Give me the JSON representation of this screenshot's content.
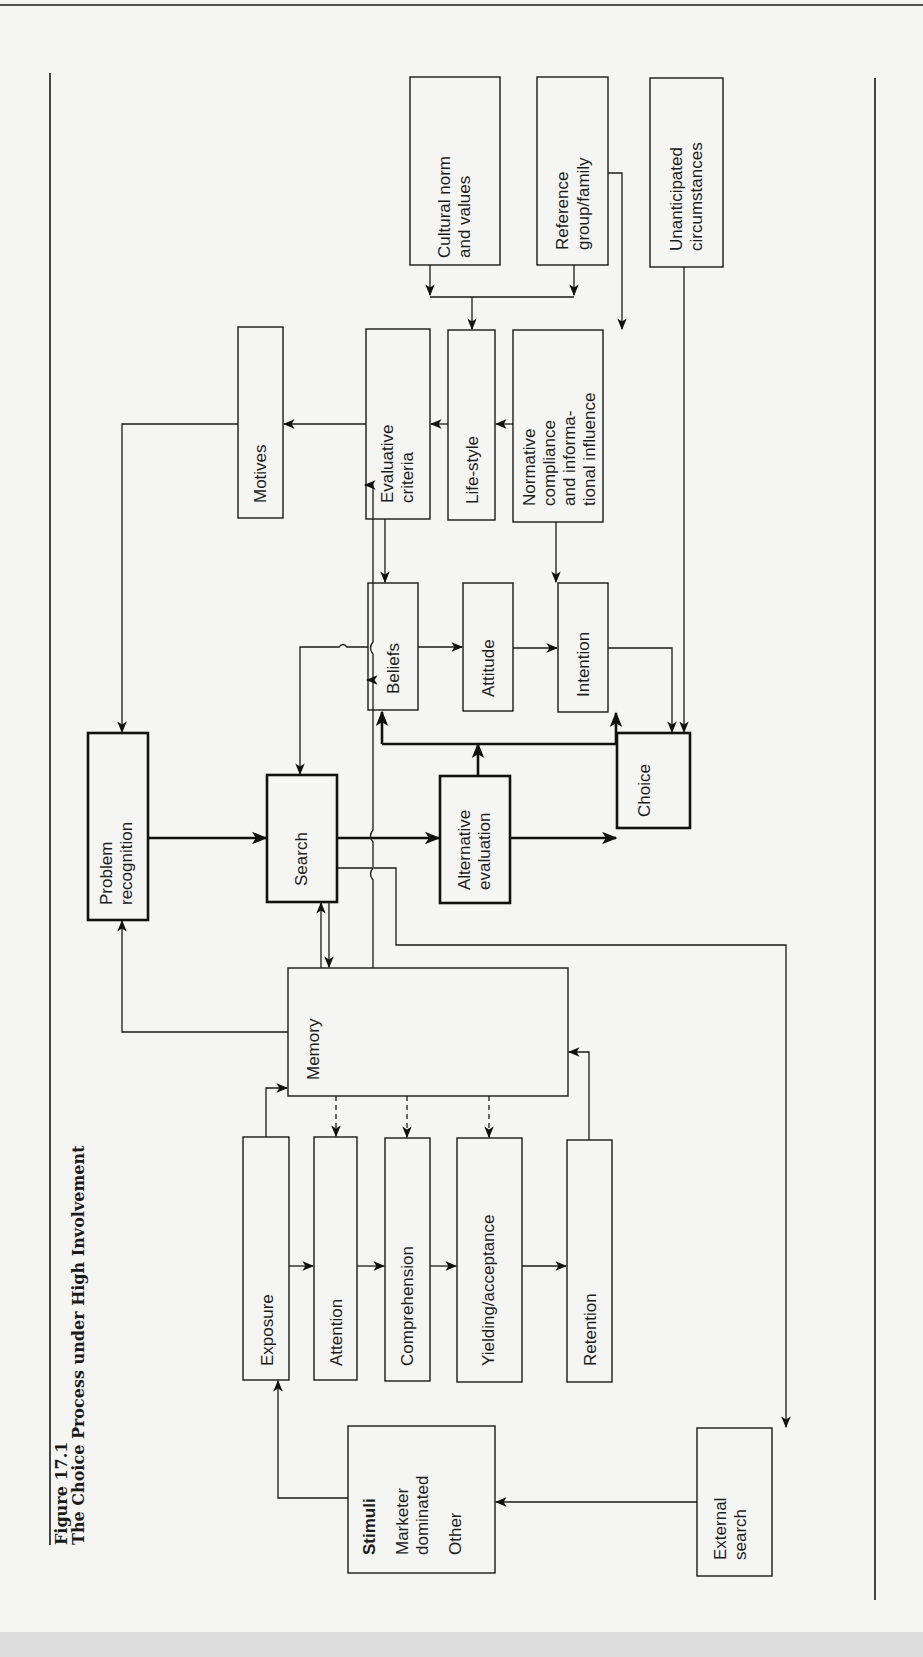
{
  "figure": {
    "number": "Figure 17.1",
    "title": "The Choice Process under High Involvement",
    "orientation": "rotated-90-ccw"
  },
  "nodes": {
    "cultural_norm": [
      "Cultural norm",
      "and values"
    ],
    "reference_group": [
      "Reference",
      "group/family"
    ],
    "unanticipated": [
      "Unanticipated",
      "circumstances"
    ],
    "motives": [
      "Motives"
    ],
    "evaluative_criteria": [
      "Evaluative",
      "criteria"
    ],
    "life_style": [
      "Life-style"
    ],
    "normative": [
      "Normative",
      "compliance",
      "and informa-",
      "tional influence"
    ],
    "beliefs": [
      "Beliefs"
    ],
    "attitude": [
      "Attitude"
    ],
    "intention": [
      "Intention"
    ],
    "problem_recognition": [
      "Problem",
      "recognition"
    ],
    "search": [
      "Search"
    ],
    "alternative_evaluation": [
      "Alternative",
      "evaluation"
    ],
    "choice": [
      "Choice"
    ],
    "memory": [
      "Memory"
    ],
    "exposure": [
      "Exposure"
    ],
    "attention": [
      "Attention"
    ],
    "comprehension": [
      "Comprehension"
    ],
    "yielding": [
      "Yielding/acceptance"
    ],
    "retention": [
      "Retention"
    ],
    "stimuli": {
      "heading": "Stimuli",
      "items": [
        "Marketer",
        "dominated",
        "Other"
      ]
    },
    "external_search": [
      "External",
      "search"
    ]
  },
  "edges": [
    {
      "from": "cultural_norm",
      "to": "life_style"
    },
    {
      "from": "reference_group",
      "to": "life_style"
    },
    {
      "from": "reference_group",
      "to": "normative"
    },
    {
      "from": "unanticipated",
      "to": "choice"
    },
    {
      "from": "normative",
      "to": "life_style"
    },
    {
      "from": "life_style",
      "to": "evaluative_criteria"
    },
    {
      "from": "evaluative_criteria",
      "to": "motives"
    },
    {
      "from": "motives",
      "to": "problem_recognition"
    },
    {
      "from": "evaluative_criteria",
      "to": "beliefs"
    },
    {
      "from": "normative",
      "to": "intention"
    },
    {
      "from": "beliefs",
      "to": "attitude"
    },
    {
      "from": "attitude",
      "to": "intention"
    },
    {
      "from": "intention",
      "to": "choice"
    },
    {
      "from": "beliefs",
      "to": "search"
    },
    {
      "from": "problem_recognition",
      "to": "search",
      "weight": "bold"
    },
    {
      "from": "search",
      "to": "alternative_evaluation",
      "weight": "bold"
    },
    {
      "from": "alternative_evaluation",
      "to": "choice",
      "weight": "bold"
    },
    {
      "from": "alternative_evaluation",
      "to": [
        "beliefs",
        "intention"
      ],
      "weight": "bold"
    },
    {
      "from": "search",
      "to": "external_search"
    },
    {
      "from": "search",
      "to": "memory",
      "bidirectional": true
    },
    {
      "from": "memory",
      "to": "problem_recognition"
    },
    {
      "from": "memory",
      "to": "evaluative_criteria"
    },
    {
      "from": "memory",
      "to": "beliefs"
    },
    {
      "from": "memory",
      "to": "attention",
      "style": "dashed"
    },
    {
      "from": "memory",
      "to": "comprehension",
      "style": "dashed"
    },
    {
      "from": "memory",
      "to": "yielding",
      "style": "dashed"
    },
    {
      "from": "exposure",
      "to": "memory"
    },
    {
      "from": "retention",
      "to": "memory"
    },
    {
      "from": "exposure",
      "to": "attention"
    },
    {
      "from": "attention",
      "to": "comprehension"
    },
    {
      "from": "comprehension",
      "to": "yielding"
    },
    {
      "from": "yielding",
      "to": "retention"
    },
    {
      "from": "stimuli",
      "to": "exposure"
    },
    {
      "from": "external_search",
      "to": "stimuli"
    }
  ]
}
